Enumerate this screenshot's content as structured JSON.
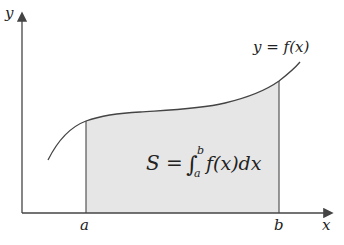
{
  "diagram": {
    "axes": {
      "x_label": "x",
      "y_label": "y"
    },
    "curve_label": "y = f(x)",
    "bounds": {
      "lower": "a",
      "upper": "b"
    },
    "area_formula": {
      "lhs": "S",
      "equals": "=",
      "integral_sign": "∫",
      "lower_limit": "a",
      "upper_limit": "b",
      "integrand": "f(x)dx"
    },
    "colors": {
      "axis": "#444444",
      "curve": "#444444",
      "shaded_region": "#e6e6e6",
      "background": "#ffffff"
    }
  }
}
